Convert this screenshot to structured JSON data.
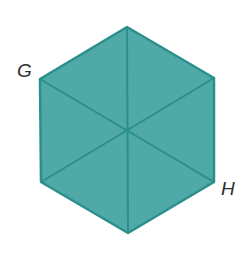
{
  "figure": {
    "shape": "regular hexagon divided into 6 triangles",
    "fill_color": "#4ea9a7",
    "stroke_color": "#2b8f8d",
    "vertices": {
      "top": [
        127,
        27
      ],
      "top_right": [
        214,
        78
      ],
      "bottom_right": [
        214,
        182
      ],
      "bottom": [
        128,
        233
      ],
      "bottom_left": [
        41,
        182
      ],
      "top_left": [
        40,
        79
      ]
    },
    "center": [
      128,
      130
    ]
  },
  "labels": {
    "g": "G",
    "h": "H"
  }
}
